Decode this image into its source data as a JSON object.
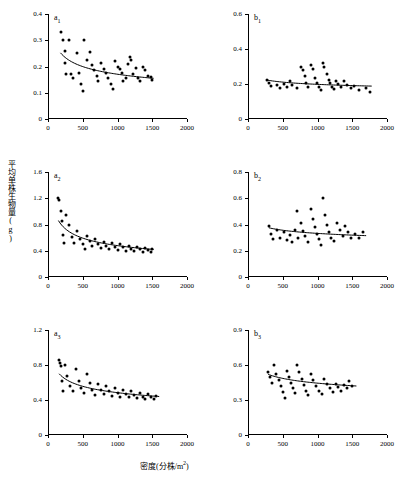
{
  "figure": {
    "axis_label_x": "密度(分株/m2)",
    "axis_label_y": "平均单株生物量(g)",
    "x_superscript": "2"
  },
  "chart_data": [
    {
      "type": "scatter",
      "title": "a1",
      "panel_label": "a",
      "panel_sub": "1",
      "xlabel": "密度(分株/m2)",
      "ylabel": "平均单株生物量(g)",
      "xlim": [
        0,
        2000
      ],
      "ylim": [
        0,
        0.4
      ],
      "xticks": [
        0,
        500,
        1000,
        1500,
        2000
      ],
      "yticks": [
        0,
        0.1,
        0.2,
        0.3,
        0.4
      ],
      "ytick_labels": [
        "0",
        "0.1",
        "0.2",
        "0.3",
        "0.4"
      ],
      "grid": false,
      "legend": "none",
      "points": [
        [
          180,
          0.33
        ],
        [
          215,
          0.3
        ],
        [
          240,
          0.26
        ],
        [
          250,
          0.215
        ],
        [
          255,
          0.17
        ],
        [
          300,
          0.3
        ],
        [
          330,
          0.17
        ],
        [
          360,
          0.155
        ],
        [
          420,
          0.25
        ],
        [
          440,
          0.175
        ],
        [
          470,
          0.135
        ],
        [
          500,
          0.105
        ],
        [
          520,
          0.3
        ],
        [
          560,
          0.225
        ],
        [
          600,
          0.255
        ],
        [
          640,
          0.205
        ],
        [
          660,
          0.185
        ],
        [
          700,
          0.165
        ],
        [
          720,
          0.145
        ],
        [
          760,
          0.215
        ],
        [
          800,
          0.19
        ],
        [
          830,
          0.175
        ],
        [
          860,
          0.155
        ],
        [
          900,
          0.135
        ],
        [
          930,
          0.115
        ],
        [
          960,
          0.22
        ],
        [
          1000,
          0.2
        ],
        [
          1030,
          0.19
        ],
        [
          1060,
          0.175
        ],
        [
          1080,
          0.145
        ],
        [
          1120,
          0.155
        ],
        [
          1150,
          0.21
        ],
        [
          1180,
          0.235
        ],
        [
          1200,
          0.225
        ],
        [
          1230,
          0.17
        ],
        [
          1260,
          0.195
        ],
        [
          1290,
          0.155
        ],
        [
          1320,
          0.145
        ],
        [
          1360,
          0.2
        ],
        [
          1400,
          0.185
        ],
        [
          1440,
          0.165
        ],
        [
          1480,
          0.16
        ],
        [
          1500,
          0.15
        ]
      ],
      "fit": {
        "x0": 180,
        "x1": 1520,
        "y0": 0.252,
        "y1": 0.155,
        "type": "power"
      }
    },
    {
      "type": "scatter",
      "title": "b1",
      "panel_label": "b",
      "panel_sub": "1",
      "xlim": [
        0,
        2000
      ],
      "ylim": [
        0,
        0.6
      ],
      "xticks": [
        0,
        500,
        1000,
        1500,
        2000
      ],
      "yticks": [
        0,
        0.2,
        0.4,
        0.6
      ],
      "ytick_labels": [
        "0",
        "0.2",
        "0.4",
        "0.6"
      ],
      "grid": false,
      "legend": "none",
      "points": [
        [
          280,
          0.225
        ],
        [
          300,
          0.205
        ],
        [
          330,
          0.19
        ],
        [
          420,
          0.195
        ],
        [
          460,
          0.175
        ],
        [
          520,
          0.2
        ],
        [
          560,
          0.185
        ],
        [
          600,
          0.215
        ],
        [
          640,
          0.195
        ],
        [
          700,
          0.175
        ],
        [
          760,
          0.3
        ],
        [
          790,
          0.28
        ],
        [
          820,
          0.245
        ],
        [
          840,
          0.205
        ],
        [
          860,
          0.185
        ],
        [
          900,
          0.31
        ],
        [
          930,
          0.285
        ],
        [
          960,
          0.235
        ],
        [
          990,
          0.205
        ],
        [
          1020,
          0.185
        ],
        [
          1050,
          0.165
        ],
        [
          1080,
          0.32
        ],
        [
          1100,
          0.3
        ],
        [
          1130,
          0.26
        ],
        [
          1160,
          0.225
        ],
        [
          1180,
          0.205
        ],
        [
          1210,
          0.185
        ],
        [
          1240,
          0.17
        ],
        [
          1270,
          0.22
        ],
        [
          1300,
          0.2
        ],
        [
          1340,
          0.185
        ],
        [
          1380,
          0.215
        ],
        [
          1420,
          0.195
        ],
        [
          1480,
          0.175
        ],
        [
          1520,
          0.19
        ],
        [
          1600,
          0.165
        ],
        [
          1700,
          0.175
        ],
        [
          1750,
          0.155
        ]
      ],
      "fit": {
        "x0": 280,
        "x1": 1780,
        "y0": 0.222,
        "y1": 0.188,
        "type": "power"
      }
    },
    {
      "type": "scatter",
      "title": "a2",
      "panel_label": "a",
      "panel_sub": "2",
      "xlim": [
        0,
        2000
      ],
      "ylim": [
        0,
        1.6
      ],
      "xticks": [
        0,
        500,
        1000,
        1500,
        2000
      ],
      "yticks": [
        0,
        0.4,
        0.8,
        1.2,
        1.6
      ],
      "ytick_labels": [
        "0",
        "0.4",
        "0.8",
        "1.2",
        "1.6"
      ],
      "grid": false,
      "legend": "none",
      "points": [
        [
          150,
          1.21
        ],
        [
          165,
          1.18
        ],
        [
          180,
          1.0
        ],
        [
          200,
          0.86
        ],
        [
          215,
          0.64
        ],
        [
          230,
          0.52
        ],
        [
          260,
          0.95
        ],
        [
          300,
          0.8
        ],
        [
          340,
          0.61
        ],
        [
          380,
          0.52
        ],
        [
          420,
          0.7
        ],
        [
          460,
          0.58
        ],
        [
          500,
          0.5
        ],
        [
          530,
          0.42
        ],
        [
          560,
          0.62
        ],
        [
          600,
          0.55
        ],
        [
          640,
          0.47
        ],
        [
          680,
          0.58
        ],
        [
          720,
          0.5
        ],
        [
          760,
          0.44
        ],
        [
          800,
          0.53
        ],
        [
          840,
          0.47
        ],
        [
          880,
          0.42
        ],
        [
          920,
          0.52
        ],
        [
          960,
          0.46
        ],
        [
          1000,
          0.41
        ],
        [
          1040,
          0.5
        ],
        [
          1080,
          0.45
        ],
        [
          1120,
          0.4
        ],
        [
          1160,
          0.47
        ],
        [
          1200,
          0.43
        ],
        [
          1240,
          0.39
        ],
        [
          1280,
          0.46
        ],
        [
          1320,
          0.42
        ],
        [
          1360,
          0.38
        ],
        [
          1400,
          0.44
        ],
        [
          1440,
          0.41
        ],
        [
          1480,
          0.38
        ],
        [
          1500,
          0.43
        ]
      ],
      "fit": {
        "x0": 150,
        "x1": 1520,
        "y0": 0.86,
        "y1": 0.42,
        "type": "power"
      }
    },
    {
      "type": "scatter",
      "title": "b2",
      "panel_label": "b",
      "panel_sub": "2",
      "xlim": [
        0,
        2000
      ],
      "ylim": [
        0,
        0.8
      ],
      "xticks": [
        0,
        500,
        1000,
        1500,
        2000
      ],
      "yticks": [
        0,
        0.2,
        0.4,
        0.6,
        0.8
      ],
      "ytick_labels": [
        "0",
        "0.2",
        "0.4",
        "0.6",
        "0.8"
      ],
      "grid": false,
      "legend": "none",
      "points": [
        [
          300,
          0.39
        ],
        [
          330,
          0.33
        ],
        [
          360,
          0.29
        ],
        [
          420,
          0.36
        ],
        [
          460,
          0.3
        ],
        [
          520,
          0.34
        ],
        [
          560,
          0.28
        ],
        [
          600,
          0.32
        ],
        [
          640,
          0.27
        ],
        [
          680,
          0.355
        ],
        [
          700,
          0.5
        ],
        [
          720,
          0.3
        ],
        [
          760,
          0.41
        ],
        [
          790,
          0.35
        ],
        [
          820,
          0.31
        ],
        [
          860,
          0.27
        ],
        [
          900,
          0.52
        ],
        [
          930,
          0.44
        ],
        [
          960,
          0.38
        ],
        [
          990,
          0.33
        ],
        [
          1020,
          0.29
        ],
        [
          1050,
          0.245
        ],
        [
          1080,
          0.6
        ],
        [
          1110,
          0.47
        ],
        [
          1140,
          0.4
        ],
        [
          1170,
          0.345
        ],
        [
          1200,
          0.3
        ],
        [
          1240,
          0.275
        ],
        [
          1280,
          0.41
        ],
        [
          1320,
          0.355
        ],
        [
          1360,
          0.31
        ],
        [
          1400,
          0.39
        ],
        [
          1440,
          0.345
        ],
        [
          1480,
          0.3
        ],
        [
          1540,
          0.33
        ],
        [
          1600,
          0.3
        ],
        [
          1660,
          0.345
        ]
      ],
      "fit": {
        "x0": 300,
        "x1": 1700,
        "y0": 0.375,
        "y1": 0.315,
        "type": "power"
      }
    },
    {
      "type": "scatter",
      "title": "a3",
      "panel_label": "a",
      "panel_sub": "3",
      "xlim": [
        0,
        2000
      ],
      "ylim": [
        0,
        1.2
      ],
      "xticks": [
        0,
        500,
        1000,
        1500,
        2000
      ],
      "yticks": [
        0,
        0.4,
        0.8,
        1.2
      ],
      "ytick_labels": [
        "0",
        "0.4",
        "0.8",
        "1.2"
      ],
      "grid": false,
      "legend": "none",
      "points": [
        [
          160,
          0.86
        ],
        [
          175,
          0.82
        ],
        [
          190,
          0.79
        ],
        [
          205,
          0.62
        ],
        [
          220,
          0.5
        ],
        [
          250,
          0.8
        ],
        [
          280,
          0.68
        ],
        [
          320,
          0.56
        ],
        [
          360,
          0.5
        ],
        [
          400,
          0.75
        ],
        [
          440,
          0.62
        ],
        [
          480,
          0.54
        ],
        [
          520,
          0.48
        ],
        [
          560,
          0.7
        ],
        [
          600,
          0.6
        ],
        [
          640,
          0.52
        ],
        [
          680,
          0.46
        ],
        [
          720,
          0.58
        ],
        [
          760,
          0.52
        ],
        [
          800,
          0.47
        ],
        [
          840,
          0.56
        ],
        [
          880,
          0.5
        ],
        [
          920,
          0.45
        ],
        [
          960,
          0.54
        ],
        [
          1000,
          0.48
        ],
        [
          1040,
          0.44
        ],
        [
          1080,
          0.52
        ],
        [
          1120,
          0.47
        ],
        [
          1160,
          0.43
        ],
        [
          1200,
          0.5
        ],
        [
          1240,
          0.46
        ],
        [
          1280,
          0.42
        ],
        [
          1320,
          0.48
        ],
        [
          1360,
          0.44
        ],
        [
          1400,
          0.41
        ],
        [
          1440,
          0.47
        ],
        [
          1480,
          0.44
        ],
        [
          1520,
          0.41
        ],
        [
          1560,
          0.45
        ]
      ],
      "fit": {
        "x0": 160,
        "x1": 1600,
        "y0": 0.7,
        "y1": 0.44,
        "type": "power"
      }
    },
    {
      "type": "scatter",
      "title": "b3",
      "panel_label": "b",
      "panel_sub": "3",
      "xlim": [
        0,
        2000
      ],
      "ylim": [
        0,
        0.9
      ],
      "xticks": [
        0,
        500,
        1000,
        1500,
        2000
      ],
      "yticks": [
        0,
        0.3,
        0.6,
        0.9
      ],
      "ytick_labels": [
        "0",
        "0.3",
        "0.6",
        "0.9"
      ],
      "grid": false,
      "legend": "none",
      "points": [
        [
          290,
          0.54
        ],
        [
          310,
          0.5
        ],
        [
          340,
          0.45
        ],
        [
          380,
          0.6
        ],
        [
          410,
          0.52
        ],
        [
          440,
          0.47
        ],
        [
          470,
          0.42
        ],
        [
          500,
          0.37
        ],
        [
          530,
          0.32
        ],
        [
          560,
          0.55
        ],
        [
          590,
          0.5
        ],
        [
          620,
          0.45
        ],
        [
          650,
          0.4
        ],
        [
          680,
          0.36
        ],
        [
          710,
          0.6
        ],
        [
          740,
          0.54
        ],
        [
          770,
          0.48
        ],
        [
          800,
          0.43
        ],
        [
          830,
          0.38
        ],
        [
          860,
          0.34
        ],
        [
          900,
          0.52
        ],
        [
          940,
          0.47
        ],
        [
          980,
          0.42
        ],
        [
          1020,
          0.38
        ],
        [
          1060,
          0.35
        ],
        [
          1100,
          0.48
        ],
        [
          1140,
          0.44
        ],
        [
          1180,
          0.4
        ],
        [
          1220,
          0.37
        ],
        [
          1260,
          0.44
        ],
        [
          1300,
          0.41
        ],
        [
          1340,
          0.38
        ],
        [
          1380,
          0.43
        ],
        [
          1420,
          0.4
        ],
        [
          1460,
          0.46
        ],
        [
          1500,
          0.42
        ]
      ],
      "fit": {
        "x0": 290,
        "x1": 1560,
        "y0": 0.52,
        "y1": 0.42,
        "type": "power"
      }
    }
  ]
}
